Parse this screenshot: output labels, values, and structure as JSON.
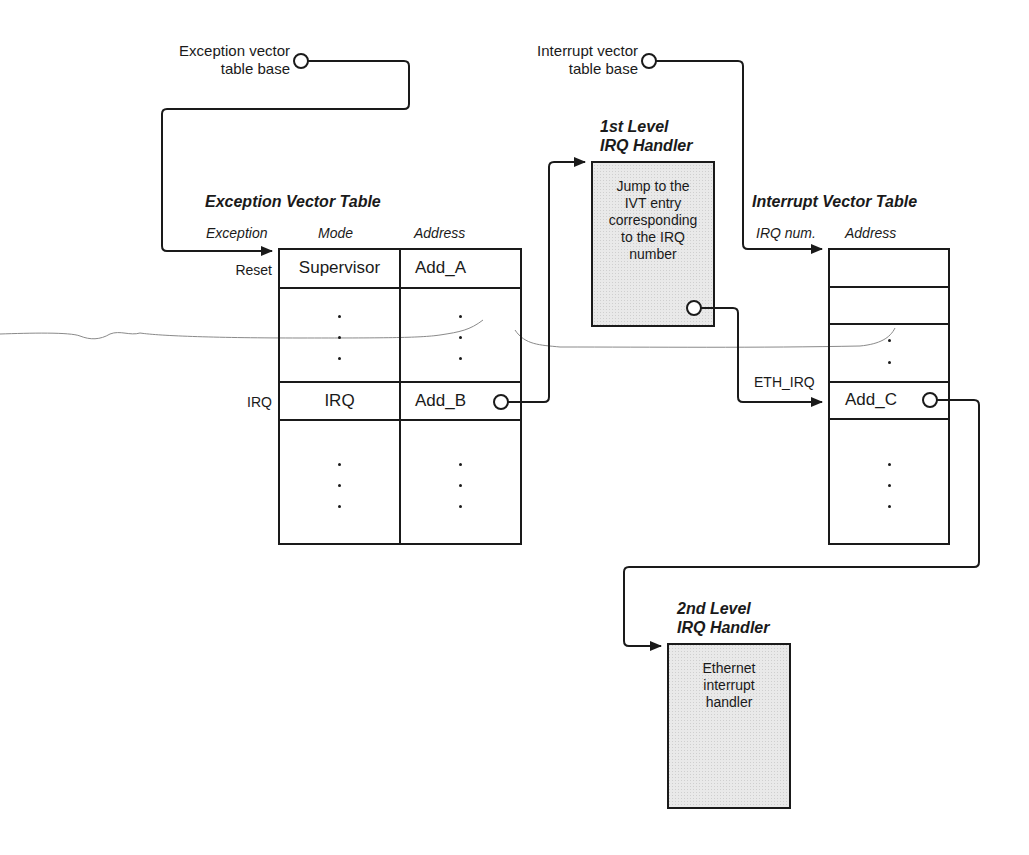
{
  "diagram": {
    "evt_base_label": [
      "Exception vector",
      "table base"
    ],
    "ivt_base_label": [
      "Interrupt vector",
      "table base"
    ],
    "exception_vector_table": {
      "title": "Exception Vector Table",
      "headers": {
        "exception": "Exception",
        "mode": "Mode",
        "address": "Address"
      },
      "rows": [
        {
          "exception": "Reset",
          "mode": "Supervisor",
          "address": "Add_A"
        },
        {
          "exception": "",
          "mode": "⋮",
          "address": "⋮"
        },
        {
          "exception": "IRQ",
          "mode": "IRQ",
          "address": "Add_B"
        },
        {
          "exception": "",
          "mode": "⋮",
          "address": "⋮"
        }
      ]
    },
    "first_level_handler": {
      "title": [
        "1st Level",
        "IRQ Handler"
      ],
      "body": [
        "Jump to the",
        "IVT entry",
        "corresponding",
        "to the IRQ",
        "number"
      ]
    },
    "interrupt_vector_table": {
      "title": "Interrupt Vector Table",
      "headers": {
        "irq_num": "IRQ num.",
        "address": "Address"
      },
      "eth_irq_label": "ETH_IRQ",
      "eth_address": "Add_C"
    },
    "second_level_handler": {
      "title": [
        "2nd Level",
        "IRQ Handler"
      ],
      "body": [
        "Ethernet",
        "interrupt",
        "handler"
      ]
    },
    "colors": {
      "line": "#1a1a1a",
      "handler_fill": "#e6e6e6",
      "scribble": "#8a8a8a"
    }
  }
}
